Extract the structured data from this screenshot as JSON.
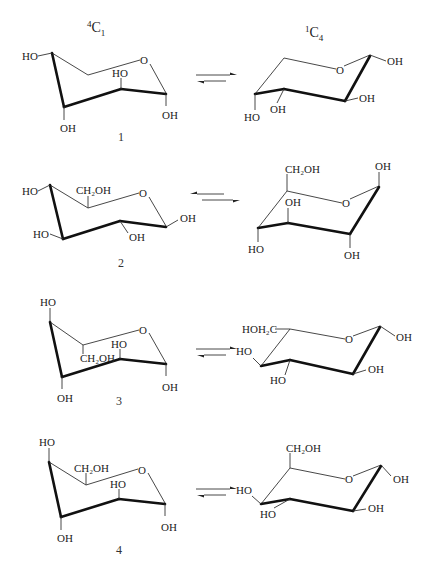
{
  "headers": {
    "left": {
      "sup": "4",
      "base": "C",
      "sub": "1"
    },
    "right": {
      "sup": "1",
      "base": "C",
      "sub": "4"
    }
  },
  "equilibrium_symbol": "⇌",
  "structures": [
    {
      "number": "1",
      "left": {
        "labels": [
          "HO",
          "O",
          "HO",
          "OH",
          "OH"
        ]
      },
      "right": {
        "labels": [
          "O",
          "OH",
          "OH",
          "OH",
          "HO"
        ]
      }
    },
    {
      "number": "2",
      "left": {
        "labels": [
          "HO",
          "CH₂OH",
          "O",
          "OH",
          "HO",
          "OH"
        ]
      },
      "right": {
        "labels": [
          "CH₂OH",
          "OH",
          "O",
          "OH",
          "HO",
          "OH"
        ]
      }
    },
    {
      "number": "3",
      "left": {
        "labels": [
          "HO",
          "O",
          "HO",
          "CH₂OH",
          "OH",
          "OH"
        ]
      },
      "right": {
        "labels": [
          "HOH₂C",
          "O",
          "OH",
          "HO",
          "OH",
          "HO"
        ]
      }
    },
    {
      "number": "4",
      "left": {
        "labels": [
          "HO",
          "CH₂OH",
          "O",
          "HO",
          "OH",
          "OH"
        ]
      },
      "right": {
        "labels": [
          "CH₂OH",
          "O",
          "OH",
          "HO",
          "OH",
          "HO"
        ]
      }
    }
  ]
}
